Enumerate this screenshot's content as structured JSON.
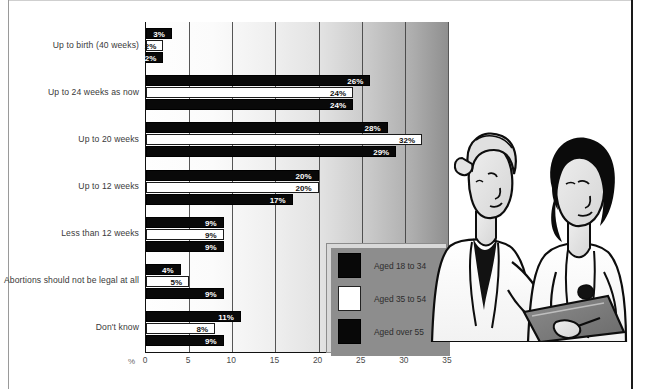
{
  "chart_data": {
    "type": "bar",
    "orientation": "horizontal",
    "title": "",
    "xlabel": "%",
    "ylabel": "",
    "xlim": [
      0,
      35
    ],
    "xticks": [
      "0",
      "5",
      "10",
      "15",
      "20",
      "25",
      "30",
      "35"
    ],
    "grid": true,
    "legend_position": "inside-bottom-right",
    "categories": [
      "Up to birth (40 weeks)",
      "Up to 24 weeks as now",
      "Up to 20 weeks",
      "Up to 12 weeks",
      "Less than 12 weeks",
      "Abortions should not be legal at all",
      "Don't know"
    ],
    "series": [
      {
        "name": "Aged 18 to 34",
        "color": "#090909",
        "values": [
          3,
          26,
          28,
          20,
          9,
          4,
          11
        ],
        "labels": [
          "3%",
          "26%",
          "28%",
          "20%",
          "9%",
          "4%",
          "11%"
        ]
      },
      {
        "name": "Aged 35 to 54",
        "color": "#ffffff",
        "values": [
          2,
          24,
          32,
          20,
          9,
          5,
          8
        ],
        "labels": [
          "2%",
          "24%",
          "32%",
          "20%",
          "9%",
          "5%",
          "8%"
        ]
      },
      {
        "name": "Aged over 55",
        "color": "#090909",
        "values": [
          2,
          24,
          29,
          17,
          9,
          9,
          9
        ],
        "labels": [
          "2%",
          "24%",
          "29%",
          "17%",
          "9%",
          "9%",
          "9%"
        ]
      }
    ]
  },
  "legend": {
    "items": [
      {
        "label": "Aged 18 to 34",
        "swatch": "dark"
      },
      {
        "label": "Aged 35 to 54",
        "swatch": "light"
      },
      {
        "label": "Aged over 55",
        "swatch": "dark"
      }
    ]
  },
  "illustration": {
    "name": "two-women-doctors-with-clipboard",
    "alt": "Illustration of two women in white lab coats reviewing a clipboard"
  }
}
